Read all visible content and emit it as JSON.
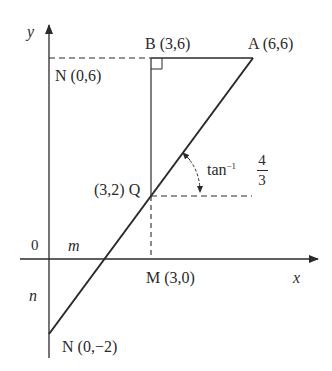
{
  "diagram": {
    "axes": {
      "x_label": "x",
      "y_label": "y",
      "origin_label": "0"
    },
    "points": {
      "A": {
        "label": "A (6,6)",
        "x": 6,
        "y": 6
      },
      "B": {
        "label": "B (3,6)",
        "x": 3,
        "y": 6
      },
      "N_top": {
        "label": "N (0,6)",
        "x": 0,
        "y": 6
      },
      "Q": {
        "label": "(3,2) Q",
        "x": 3,
        "y": 2
      },
      "M": {
        "label": "M (3,0)",
        "x": 3,
        "y": 0
      },
      "N_bottom": {
        "label": "N (0,−2)",
        "x": 0,
        "y": -2
      }
    },
    "region_labels": {
      "m": "m",
      "n": "n"
    },
    "angle": {
      "prefix": "tan",
      "exponent": "−1",
      "numerator": "4",
      "denominator": "3"
    },
    "colors": {
      "ink": "#2a2a2a",
      "background": "#ffffff"
    }
  }
}
